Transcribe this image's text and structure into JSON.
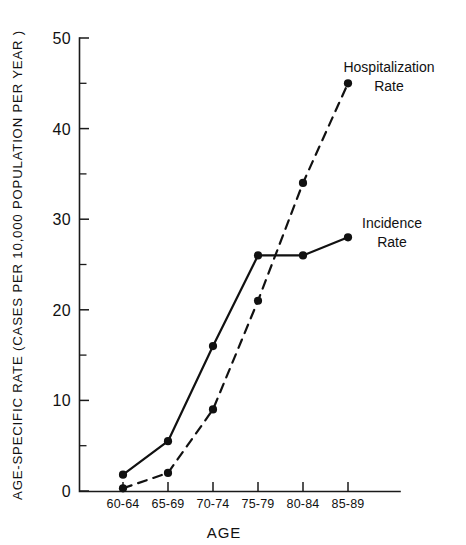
{
  "chart_data": {
    "type": "line",
    "title": "",
    "xlabel": "AGE",
    "ylabel": "AGE-SPECIFIC RATE  (CASES PER 10,000 POPULATION PER YEAR )",
    "categories": [
      "60-64",
      "65-69",
      "70-74",
      "75-79",
      "80-84",
      "85-89"
    ],
    "ylim": [
      0,
      50
    ],
    "xlim_labels": [
      "60-64",
      "85-89"
    ],
    "y_major_ticks": [
      0,
      10,
      20,
      30,
      40,
      50
    ],
    "y_minor_ticks": [
      5,
      15,
      25,
      35,
      45
    ],
    "y_tick_labels": [
      "0",
      "10",
      "20",
      "30",
      "40",
      "50"
    ],
    "grid": false,
    "legend_position": "inline-annotation",
    "series": [
      {
        "name": "Incidence Rate",
        "style": "solid",
        "color": "#111111",
        "values": [
          1.8,
          5.5,
          16,
          26,
          26,
          28
        ]
      },
      {
        "name": "Hospitalization Rate",
        "style": "dashed",
        "color": "#111111",
        "values": [
          0.3,
          2,
          9,
          21,
          34,
          45
        ]
      }
    ],
    "annotations": [
      {
        "id": "hospitalization",
        "line1": "Hospitalization",
        "line2": "Rate",
        "x": 389,
        "y": 72
      },
      {
        "id": "incidence",
        "line1": "Incidence",
        "line2": "Rate",
        "x": 392,
        "y": 228
      }
    ]
  },
  "axis": {
    "y_label_text": "AGE-SPECIFIC RATE  (CASES PER 10,000 POPULATION PER YEAR )",
    "x_label_text": "AGE"
  },
  "ticks": {
    "y": [
      {
        "value": 50,
        "label": "50"
      },
      {
        "value": 40,
        "label": "40"
      },
      {
        "value": 30,
        "label": "30"
      },
      {
        "value": 20,
        "label": "20"
      },
      {
        "value": 10,
        "label": "10"
      },
      {
        "value": 0,
        "label": "0"
      }
    ],
    "x": [
      {
        "label": "60-64"
      },
      {
        "label": "65-69"
      },
      {
        "label": "70-74"
      },
      {
        "label": "75-79"
      },
      {
        "label": "80-84"
      },
      {
        "label": "85-89"
      }
    ]
  }
}
